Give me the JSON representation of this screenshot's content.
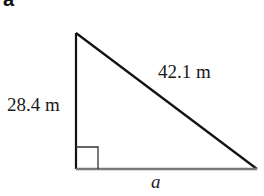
{
  "figure": {
    "part_label": "a",
    "shape": "right-triangle",
    "sides": {
      "vertical_leg": "28.4 m",
      "hypotenuse": "42.1 m",
      "base_leg": "a"
    },
    "right_angle_marker": true,
    "colors": {
      "line": "#111111",
      "base_line": "#777777",
      "text": "#1a1a1a"
    }
  }
}
